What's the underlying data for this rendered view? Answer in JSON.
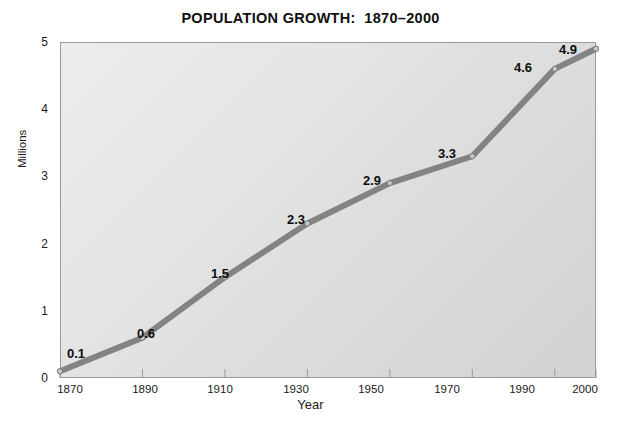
{
  "chart_data": {
    "type": "line",
    "title": "POPULATION GROWTH:  1870–2000",
    "xlabel": "Year",
    "ylabel": "Millions",
    "x": [
      1870,
      1890,
      1910,
      1930,
      1950,
      1970,
      1990,
      2000
    ],
    "values": [
      0.1,
      0.6,
      1.5,
      2.3,
      2.9,
      3.3,
      4.6,
      4.9
    ],
    "point_labels": [
      "0.1",
      "0.6",
      "1.5",
      "2.3",
      "2.9",
      "3.3",
      "4.6",
      "4.9"
    ],
    "categories": [
      "1870",
      "1890",
      "1910",
      "1930",
      "1950",
      "1970",
      "1990",
      "2000"
    ],
    "xtick_labels": [
      "1870",
      "1890",
      "1910",
      "1930",
      "1950",
      "1970",
      "1990",
      "2000"
    ],
    "ytick_labels": [
      "0",
      "1",
      "2",
      "3",
      "4",
      "5"
    ],
    "ytick_values": [
      0,
      1,
      2,
      3,
      4,
      5
    ],
    "ylim": [
      0,
      5
    ],
    "xlim": [
      1870,
      2000
    ],
    "grid": false,
    "legend": false,
    "legend_position": "none",
    "series": [
      {
        "name": "Population",
        "values": [
          0.1,
          0.6,
          1.5,
          2.3,
          2.9,
          3.3,
          4.6,
          4.9
        ]
      }
    ],
    "colors": {
      "line": "#838383",
      "marker": "#c9c9c9",
      "marker_edge": "#6e6e6e",
      "plot_background_light": "#ececec",
      "plot_background_dark": "#d2d2d2",
      "axis_border": "#9a9a9a",
      "text": "#101010"
    }
  }
}
